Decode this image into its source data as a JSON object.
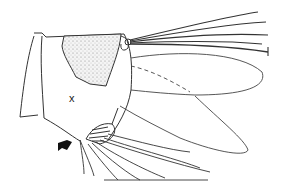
{
  "figure": {
    "labels": {
      "region_marker": "x"
    },
    "annotations": {
      "arrow": "arrow-pointer"
    },
    "colors": {
      "line": "#333333",
      "stipple_fill": "#e4e4e4",
      "background": "#ffffff"
    }
  }
}
